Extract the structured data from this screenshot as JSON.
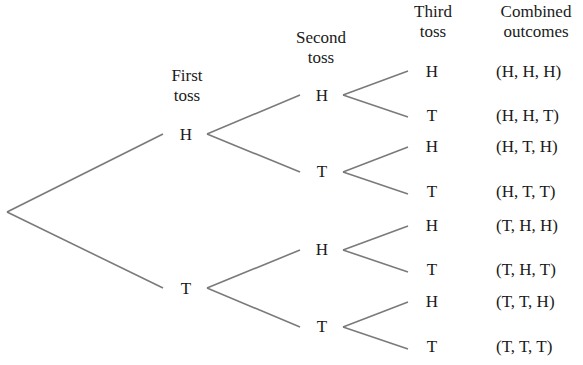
{
  "diagram": {
    "line_color": "#7a7a7a",
    "headers": {
      "first": [
        "First",
        "toss"
      ],
      "second": [
        "Second",
        "toss"
      ],
      "third": [
        "Third",
        "toss"
      ],
      "combined": [
        "Combined",
        "outcomes"
      ]
    },
    "first_toss": [
      "H",
      "T"
    ],
    "second_toss": [
      "H",
      "T",
      "H",
      "T"
    ],
    "third_toss": [
      "H",
      "T",
      "H",
      "T",
      "H",
      "T",
      "H",
      "T"
    ],
    "outcomes": [
      "(H, H, H)",
      "(H, H, T)",
      "(H, T, H)",
      "(H, T, T)",
      "(T, H, H)",
      "(T, H, T)",
      "(T, T, H)",
      "(T, T, T)"
    ]
  }
}
